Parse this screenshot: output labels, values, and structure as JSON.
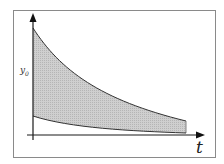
{
  "diagram": {
    "type": "shaded-region-between-decaying-curves",
    "labels": {
      "y_axis_marker": "y",
      "y_axis_marker_sub": "0",
      "x_axis": "t"
    },
    "colors": {
      "frame": "#8a8a8a",
      "axis": "#1a1a1a",
      "fill": "#c4c4c4",
      "curve": "#333333",
      "background": "#ffffff"
    },
    "axes": {
      "x_axis_arrow": "right",
      "y_axis_arrow": "up"
    },
    "curves": [
      {
        "name": "upper-decay-curve",
        "start_label": "y0",
        "shape": "exponential-decay"
      },
      {
        "name": "lower-decay-curve",
        "shape": "exponential-decay-to-baseline"
      }
    ]
  }
}
